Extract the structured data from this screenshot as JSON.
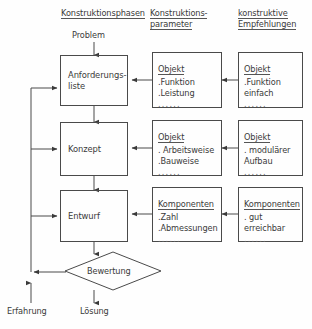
{
  "diagram": {
    "columns": [
      {
        "id": "phases",
        "title_lines": [
          "Konstruktionsphasen"
        ]
      },
      {
        "id": "parameters",
        "title_lines": [
          "Konstruktions-",
          "parameter"
        ]
      },
      {
        "id": "recommendations",
        "title_lines": [
          "konstruktive",
          "Empfehlungen"
        ]
      }
    ],
    "entry_label": "Problem",
    "phases": [
      {
        "id": "anforderungsliste",
        "line1": "Anforderungs-",
        "line2": "liste"
      },
      {
        "id": "konzept",
        "line1": "Konzept",
        "line2": ""
      },
      {
        "id": "entwurf",
        "line1": "Entwurf",
        "line2": ""
      }
    ],
    "parameters": [
      {
        "title": "Objekt",
        "lines": [
          ".Funktion",
          ".Leistung"
        ],
        "dots": "......"
      },
      {
        "title": "Objekt",
        "lines": [
          ". Arbeitsweise",
          ".Bauweise"
        ],
        "dots": "......"
      },
      {
        "title": "Komponenten",
        "lines": [
          ".Zahl",
          ".Abmessungen"
        ],
        "dots": "......"
      }
    ],
    "recommendations": [
      {
        "title": "Objekt",
        "lines": [
          ".Funktion",
          "  einfach"
        ],
        "dots": "......"
      },
      {
        "title": "Objekt",
        "lines": [
          ". modulärer",
          "  Aufbau"
        ],
        "dots": "......"
      },
      {
        "title": "Komponenten",
        "lines": [
          ". gut",
          "  erreichbar"
        ],
        "dots": "......"
      }
    ],
    "decision": {
      "label": "Bewertung"
    },
    "feedback_label": "Erfahrung",
    "output_label": "Lösung",
    "colors": {
      "stroke": "#4a4a4a",
      "text": "#3a3a3a",
      "background": "#fefefe"
    }
  }
}
